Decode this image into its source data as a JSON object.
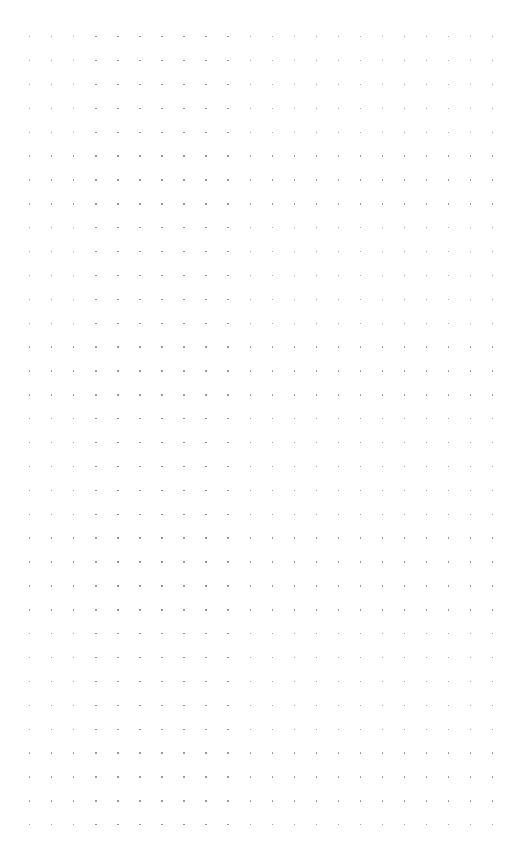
{
  "canvas": {
    "type": "dot-grid",
    "background": "#ffffff",
    "dot_color": "#8a8a8a",
    "columns": 22,
    "rows": 34,
    "origin_x": 29,
    "origin_y": 36,
    "spacing_x": 22.05,
    "spacing_y": 23.88
  }
}
